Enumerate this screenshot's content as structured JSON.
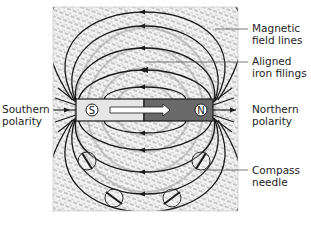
{
  "figure": {
    "magnet": {
      "south_pole_letter": "S",
      "north_pole_letter": "N",
      "south_color": "#e6e6e6",
      "north_color": "#6a6a6a"
    },
    "labels": {
      "magnetic_field_lines": [
        "Magnetic",
        "field lines"
      ],
      "aligned_iron_filings": [
        "Aligned",
        "iron filings"
      ],
      "southern_polarity": [
        "Southern",
        "polarity"
      ],
      "northern_polarity": [
        "Northern",
        "polarity"
      ],
      "compass_needle": [
        "Compass",
        "needle"
      ]
    },
    "colors": {
      "background": "#ffffff",
      "filings": "#9a9a9a",
      "field_line": "#1a1a1a",
      "text": "#1e1e1e"
    }
  }
}
